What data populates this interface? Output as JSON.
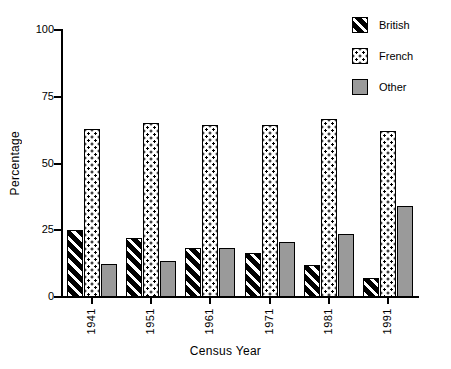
{
  "chart_data": {
    "type": "bar",
    "title": "",
    "subtitle": "",
    "xlabel": "Census Year",
    "ylabel": "Percentage",
    "categories": [
      "1941",
      "1951",
      "1961",
      "1971",
      "1981",
      "1991"
    ],
    "series": [
      {
        "name": "British",
        "pattern": "diagonal-hatch",
        "color": "#000000",
        "values": [
          25,
          22,
          18.5,
          16.5,
          12,
          7
        ]
      },
      {
        "name": "French",
        "pattern": "dotted",
        "color": "#ffffff",
        "values": [
          63,
          65,
          64.5,
          64.5,
          66.5,
          62
        ]
      },
      {
        "name": "Other",
        "pattern": "solid-gray",
        "color": "#9a9a9a",
        "values": [
          12.5,
          13.5,
          18.5,
          20.5,
          23.5,
          34
        ]
      }
    ],
    "ylim": [
      0,
      100
    ],
    "yticks": [
      "0",
      "25",
      "50",
      "75",
      "100"
    ],
    "ytick_values": [
      0,
      25,
      50,
      75,
      100
    ],
    "grid": false,
    "legend_position": "top-right",
    "legend_entries": [
      "British",
      "French",
      "Other"
    ]
  },
  "axes": {
    "y_title": "Percentage",
    "x_title": "Census Year"
  }
}
